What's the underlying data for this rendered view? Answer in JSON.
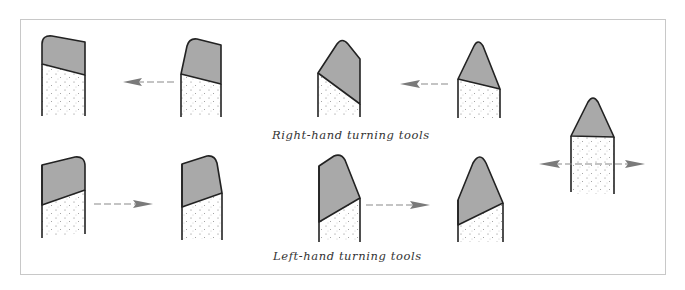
{
  "figure": {
    "captions": {
      "right_hand": "Right-hand turning tools",
      "left_hand": "Left-hand turning tools"
    },
    "colors": {
      "tip_fill": "#a9a9a9",
      "outline": "#222222",
      "arrow": "#7a7a7a",
      "frame": "#c8c8c8"
    },
    "rows": [
      {
        "name": "right-hand",
        "tools": [
          "square-nose",
          "bevel-nose",
          "angled-point",
          "pointed"
        ],
        "feed_direction": "left"
      },
      {
        "name": "left-hand",
        "tools": [
          "square-nose",
          "bevel-nose",
          "angled-point",
          "pointed"
        ],
        "feed_direction": "right"
      }
    ],
    "neutral_tool": {
      "name": "round-nose",
      "feed_direction": "both"
    }
  }
}
